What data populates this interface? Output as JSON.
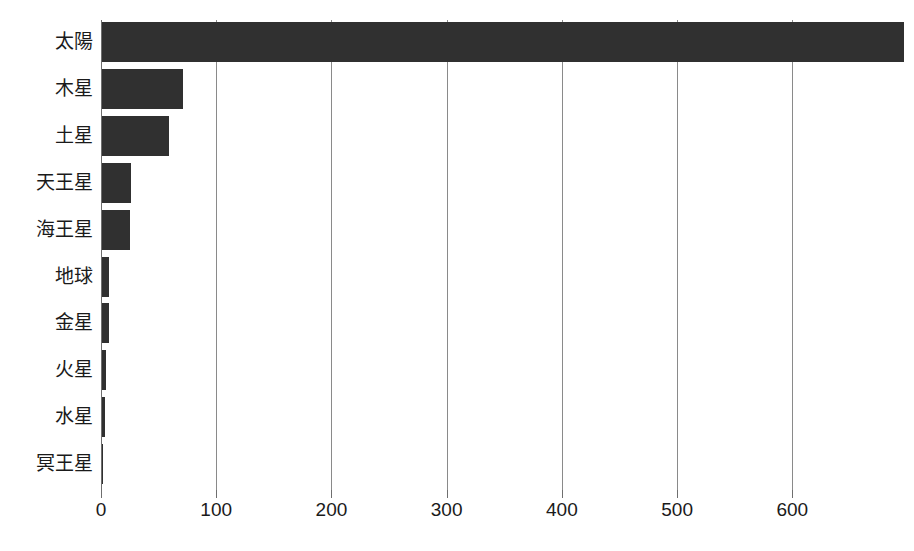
{
  "chart_data": {
    "type": "bar",
    "orientation": "horizontal",
    "title": "",
    "subtitle": "",
    "xlabel": "",
    "ylabel": "",
    "categories": [
      "太陽",
      "木星",
      "土星",
      "天王星",
      "海王星",
      "地球",
      "金星",
      "火星",
      "水星",
      "冥王星"
    ],
    "values": [
      696,
      69.9,
      58.2,
      25.4,
      24.6,
      6.4,
      6.1,
      3.4,
      2.4,
      1.2
    ],
    "series": [
      {
        "name": "",
        "values": [
          696,
          69.9,
          58.2,
          25.4,
          24.6,
          6.4,
          6.1,
          3.4,
          2.4,
          1.2
        ]
      }
    ],
    "xlim": [
      0,
      703
    ],
    "xticks": [
      0,
      100,
      200,
      300,
      400,
      500,
      600
    ],
    "xtick_labels": [
      "0",
      "100",
      "200",
      "300",
      "400",
      "500",
      "600"
    ],
    "grid": "vertical",
    "legend": "none",
    "bar_color": "#303030",
    "gridline_color": "#8a8a8a",
    "background_color": "#ffffff",
    "text_color": "#1a1a1a"
  },
  "figure": {
    "clipped_top_text": "",
    "plot": {
      "left_px": 101,
      "top_px": 20,
      "width_px": 810,
      "height_px": 470,
      "px_per_unit": 1.152
    },
    "bar_layout": {
      "row_pitch_px": 46.9,
      "bar_height_px": 40,
      "first_row_top_px": 2
    }
  }
}
